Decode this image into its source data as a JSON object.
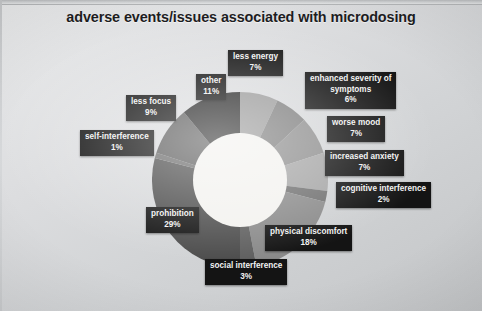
{
  "title": "adverse events/issues associated with microdosing",
  "chart_data": {
    "type": "pie",
    "title": "adverse events/issues associated with microdosing",
    "xlabel": "",
    "ylabel": "",
    "donut": true,
    "grid": false,
    "legend_position": "none",
    "value_unit": "%",
    "labels": [
      "less energy",
      "enhanced severity of symptoms",
      "worse mood",
      "increased anxiety",
      "cognitive interference",
      "physical discomfort",
      "social interference",
      "prohibition",
      "self-interference",
      "less focus",
      "other"
    ],
    "values": [
      7,
      6,
      7,
      7,
      2,
      18,
      3,
      29,
      1,
      9,
      11
    ],
    "colors": [
      "#9a9a9a",
      "#7e7e7e",
      "#8d8d8d",
      "#a5a5a5",
      "#6f6f6f",
      "#8a8a8a",
      "#606060",
      "#4d4d4d",
      "#6a6a6a",
      "#5c5c5c",
      "#2a2a2a"
    ],
    "slices": [
      {
        "label": "less energy",
        "value": 7,
        "display_value": "7%",
        "color": "#9a9a9a"
      },
      {
        "label": "enhanced severity of symptoms",
        "value": 6,
        "display_value": "6%",
        "color": "#7e7e7e"
      },
      {
        "label": "worse mood",
        "value": 7,
        "display_value": "7%",
        "color": "#8d8d8d"
      },
      {
        "label": "increased anxiety",
        "value": 7,
        "display_value": "7%",
        "color": "#a5a5a5"
      },
      {
        "label": "cognitive interference",
        "value": 2,
        "display_value": "2%",
        "color": "#6f6f6f"
      },
      {
        "label": "physical discomfort",
        "value": 18,
        "display_value": "18%",
        "color": "#8a8a8a"
      },
      {
        "label": "social interference",
        "value": 3,
        "display_value": "3%",
        "color": "#606060"
      },
      {
        "label": "prohibition",
        "value": 29,
        "display_value": "29%",
        "color": "#4d4d4d"
      },
      {
        "label": "self-interference",
        "value": 1,
        "display_value": "1%",
        "color": "#6a6a6a"
      },
      {
        "label": "less focus",
        "value": 9,
        "display_value": "9%",
        "color": "#5c5c5c"
      },
      {
        "label": "other",
        "value": 11,
        "display_value": "11%",
        "color": "#2a2a2a"
      }
    ]
  },
  "labels": {
    "less_energy": {
      "name": "less energy",
      "value": "7%"
    },
    "enhanced_severity": {
      "name": "enhanced severity of",
      "name2": "symptoms",
      "value": "6%"
    },
    "worse_mood": {
      "name": "worse mood",
      "value": "7%"
    },
    "increased_anxiety": {
      "name": "increased anxiety",
      "value": "7%"
    },
    "cognitive": {
      "name": "cognitive interference",
      "value": "2%"
    },
    "physical": {
      "name": "physical discomfort",
      "value": "18%"
    },
    "social": {
      "name": "social interference",
      "value": "3%"
    },
    "prohibition": {
      "name": "prohibition",
      "value": "29%"
    },
    "self_interference": {
      "name": "self-interference",
      "value": "1%"
    },
    "less_focus": {
      "name": "less focus",
      "value": "9%"
    },
    "other": {
      "name": "other",
      "value": "11%"
    }
  }
}
